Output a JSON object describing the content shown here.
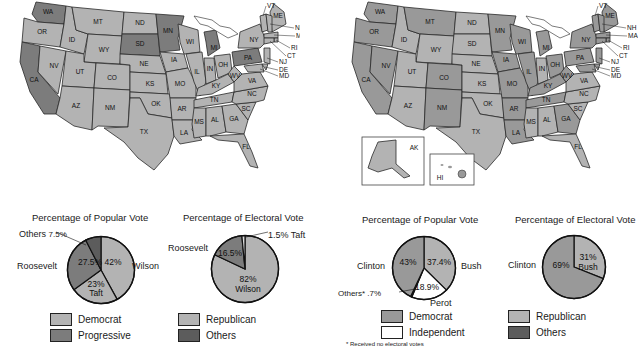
{
  "colors": {
    "light": "#b3b3b3",
    "dark": "#7c7c7c",
    "mid": "#999999",
    "white": "#ffffff",
    "stroke": "#222222"
  },
  "maps": [
    {
      "id": "1912",
      "states": {
        "WA": "dark",
        "OR": "light",
        "CA": "dark",
        "ID": "light",
        "NV": "light",
        "MT": "light",
        "WY": "light",
        "UT": "light",
        "AZ": "light",
        "CO": "light",
        "NM": "light",
        "ND": "light",
        "SD": "dark",
        "NE": "light",
        "KS": "light",
        "OK": "light",
        "TX": "light",
        "MN": "dark",
        "IA": "light",
        "MO": "light",
        "AR": "light",
        "LA": "light",
        "WI": "light",
        "IL": "light",
        "MI": "dark",
        "IN": "light",
        "OH": "light",
        "KY": "light",
        "TN": "light",
        "MS": "light",
        "AL": "light",
        "GA": "light",
        "FL": "light",
        "SC": "light",
        "NC": "light",
        "VA": "light",
        "WV": "light",
        "PA": "dark",
        "NY": "light",
        "VT": "light",
        "ME": "light",
        "NH": "light",
        "MA": "light",
        "RI": "light",
        "CT": "light",
        "NJ": "light",
        "DE": "light",
        "MD": "light"
      },
      "callouts": [
        "VT",
        "ME",
        "NH",
        "MA",
        "RI",
        "CT",
        "NJ",
        "DE",
        "MD"
      ]
    },
    {
      "id": "1992",
      "states": {
        "WA": "mid",
        "OR": "mid",
        "CA": "mid",
        "ID": "light",
        "NV": "mid",
        "MT": "mid",
        "WY": "light",
        "UT": "light",
        "AZ": "light",
        "CO": "mid",
        "NM": "mid",
        "ND": "light",
        "SD": "light",
        "NE": "light",
        "KS": "light",
        "OK": "light",
        "TX": "light",
        "MN": "mid",
        "IA": "mid",
        "MO": "mid",
        "AR": "mid",
        "LA": "mid",
        "WI": "mid",
        "IL": "mid",
        "MI": "mid",
        "IN": "light",
        "OH": "mid",
        "KY": "mid",
        "TN": "mid",
        "MS": "light",
        "AL": "light",
        "GA": "mid",
        "FL": "light",
        "SC": "light",
        "NC": "light",
        "VA": "light",
        "WV": "mid",
        "PA": "mid",
        "NY": "mid",
        "VT": "mid",
        "ME": "mid",
        "NH": "mid",
        "MA": "mid",
        "RI": "mid",
        "CT": "mid",
        "NJ": "mid",
        "DE": "mid",
        "MD": "mid",
        "AK": "light",
        "HI": "mid"
      },
      "callouts": [
        "VT",
        "ME",
        "NH",
        "MA",
        "RI",
        "CT",
        "NJ",
        "DE",
        "MD"
      ],
      "insets": [
        {
          "label": "AK"
        },
        {
          "label": "HI"
        }
      ]
    }
  ],
  "charts": {
    "popular_1912": {
      "title": "Percentage of Popular Vote",
      "labels": {
        "wilson": "Wilson",
        "roosevelt": "Roosevelt",
        "others": "Others",
        "others_pct": "7.5%",
        "wilson_pct": "42%",
        "roosevelt_pct": "27.5%",
        "taft_pct": "23%",
        "taft": "Taft"
      }
    },
    "electoral_1912": {
      "title": "Percentage of Electoral Vote",
      "labels": {
        "roosevelt": "Roosevelt",
        "roosevelt_pct": "16.5%",
        "taft": "1.5% Taft",
        "wilson_pct": "82%",
        "wilson": "Wilson"
      }
    },
    "popular_1992": {
      "title": "Percentage of Popular Vote",
      "labels": {
        "clinton": "Clinton",
        "clinton_pct": "43%",
        "bush_pct": "37.4%",
        "bush": "Bush",
        "perot_pct": "18.9%",
        "perot": "Perot",
        "others": "Others* .7%"
      }
    },
    "electoral_1992": {
      "title": "Percentage of Electoral Vote",
      "labels": {
        "clinton": "Clinton",
        "clinton_pct": "69%",
        "bush_pct": "31%",
        "bush": "Bush"
      }
    }
  },
  "legends": {
    "l1912a": [
      {
        "label": "Democrat",
        "color": "#b3b3b3"
      },
      {
        "label": "Progressive",
        "color": "#7c7c7c"
      }
    ],
    "l1912b": [
      {
        "label": "Republican",
        "color": "#b3b3b3"
      },
      {
        "label": "Others",
        "color": "#5c5c5c"
      }
    ],
    "l1992a": [
      {
        "label": "Democrat",
        "color": "#999999"
      },
      {
        "label": "Independent",
        "color": "#ffffff"
      }
    ],
    "l1992b": [
      {
        "label": "Republican",
        "color": "#b3b3b3"
      },
      {
        "label": "Others",
        "color": "#5c5c5c"
      }
    ]
  },
  "footnote": "* Received no electoral votes",
  "chart_data": [
    {
      "type": "pie",
      "title": "Percentage of Popular Vote",
      "categories": [
        "Wilson (Democrat)",
        "Taft (Republican)",
        "Roosevelt (Progressive)",
        "Others"
      ],
      "values": [
        42,
        23,
        27.5,
        7.5
      ],
      "colors": [
        "#b3b3b3",
        "#b3b3b3",
        "#7c7c7c",
        "#5c5c5c"
      ]
    },
    {
      "type": "pie",
      "title": "Percentage of Electoral Vote",
      "categories": [
        "Wilson (Democrat)",
        "Roosevelt (Progressive)",
        "Taft (Republican)"
      ],
      "values": [
        82,
        16.5,
        1.5
      ],
      "colors": [
        "#b3b3b3",
        "#7c7c7c",
        "#dddddd"
      ]
    },
    {
      "type": "pie",
      "title": "Percentage of Popular Vote",
      "categories": [
        "Bush (Republican)",
        "Perot (Independent)",
        "Others*",
        "Clinton (Democrat)"
      ],
      "values": [
        37.4,
        18.9,
        0.7,
        43
      ],
      "colors": [
        "#b3b3b3",
        "#ffffff",
        "#333333",
        "#999999"
      ]
    },
    {
      "type": "pie",
      "title": "Percentage of Electoral Vote",
      "categories": [
        "Bush (Republican)",
        "Clinton (Democrat)"
      ],
      "values": [
        31,
        69
      ],
      "colors": [
        "#b3b3b3",
        "#999999"
      ]
    }
  ]
}
